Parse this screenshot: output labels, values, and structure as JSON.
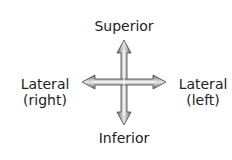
{
  "diagram": {
    "labels": {
      "top": "Superior",
      "bottom": "Inferior",
      "left_line1": "Lateral",
      "left_line2": "(right)",
      "right_line1": "Lateral",
      "right_line2": "(left)"
    },
    "colors": {
      "arrow_fill": "#9a9a9a",
      "arrow_outline": "#444444",
      "text": "#222222"
    }
  }
}
